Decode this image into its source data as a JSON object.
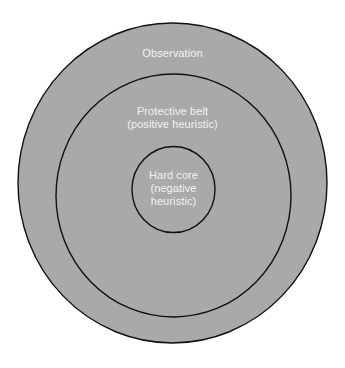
{
  "diagram": {
    "type": "concentric-circles",
    "colors": {
      "fill": "#a9a9a9",
      "stroke": "#111111",
      "text": "#f2f2f2",
      "background": "#ffffff"
    },
    "rings": [
      {
        "id": "observation",
        "label_lines": [
          "Observation"
        ]
      },
      {
        "id": "protective-belt",
        "label_lines": [
          "Protective belt",
          "(positive heuristic)"
        ]
      },
      {
        "id": "hard-core",
        "label_lines": [
          "Hard core",
          "(negative",
          "heuristic)"
        ]
      }
    ]
  }
}
